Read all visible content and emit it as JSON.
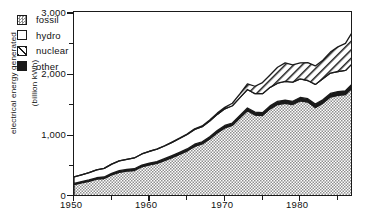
{
  "chart_data": {
    "type": "area",
    "stacked": true,
    "title": "",
    "xlabel": "",
    "ylabel": "electrical energy generated\n(billion kWh)",
    "xlim": [
      1950,
      1987
    ],
    "ylim": [
      0,
      3000
    ],
    "ytick_labels": [
      "0",
      "1,000",
      "2,000",
      "3,000"
    ],
    "ytick_values": [
      0,
      1000,
      2000,
      3000
    ],
    "yminor_ticks": [
      500,
      1500,
      2500
    ],
    "xtick_labels": [
      "1950",
      "1960",
      "1970",
      "1980"
    ],
    "xtick_values": [
      1950,
      1960,
      1970,
      1980
    ],
    "xminor_ticks": [
      1955,
      1965,
      1975,
      1985
    ],
    "grid": false,
    "legend_position": "upper-left",
    "x": [
      1950,
      1951,
      1952,
      1953,
      1954,
      1955,
      1956,
      1957,
      1958,
      1959,
      1960,
      1961,
      1962,
      1963,
      1964,
      1965,
      1966,
      1967,
      1968,
      1969,
      1970,
      1971,
      1972,
      1973,
      1974,
      1975,
      1976,
      1977,
      1978,
      1979,
      1980,
      1981,
      1982,
      1983,
      1984,
      1985,
      1986,
      1987
    ],
    "series": [
      {
        "name": "fossil",
        "pattern": "crosshatch",
        "values": [
          200,
          230,
          255,
          290,
          300,
          360,
          400,
          420,
          430,
          490,
          520,
          545,
          590,
          640,
          690,
          745,
          820,
          860,
          940,
          1040,
          1120,
          1160,
          1280,
          1400,
          1330,
          1320,
          1430,
          1500,
          1520,
          1500,
          1560,
          1540,
          1450,
          1520,
          1620,
          1650,
          1660,
          1780
        ]
      },
      {
        "name": "other",
        "pattern": "solid-black",
        "values": [
          20,
          20,
          22,
          22,
          24,
          24,
          26,
          26,
          28,
          28,
          30,
          30,
          32,
          32,
          34,
          34,
          36,
          36,
          38,
          38,
          40,
          40,
          42,
          44,
          46,
          46,
          48,
          50,
          50,
          52,
          54,
          54,
          56,
          58,
          60,
          60,
          62,
          64
        ]
      },
      {
        "name": "hydro",
        "pattern": "white",
        "values": [
          105,
          110,
          118,
          128,
          140,
          150,
          160,
          165,
          175,
          180,
          190,
          200,
          205,
          215,
          225,
          235,
          240,
          245,
          255,
          262,
          270,
          280,
          290,
          300,
          300,
          310,
          300,
          295,
          305,
          310,
          300,
          295,
          320,
          340,
          330,
          325,
          330,
          330
        ]
      },
      {
        "name": "nuclear",
        "pattern": "diagonal-hatch",
        "values": [
          0,
          0,
          0,
          0,
          0,
          0,
          0,
          0,
          0,
          0,
          2,
          3,
          4,
          5,
          6,
          8,
          10,
          12,
          16,
          20,
          25,
          40,
          60,
          90,
          120,
          180,
          200,
          260,
          300,
          280,
          260,
          290,
          300,
          300,
          340,
          400,
          440,
          520
        ]
      }
    ],
    "totals_note": "values are stacked; top of stack reaches about 2,700 billion kWh at the right edge",
    "colors": {
      "axis": "#1a1a1a",
      "text": "#111111",
      "fossil": "#9a9a9a",
      "hydro": "#ffffff",
      "nuclear": "#ffffff",
      "other": "#1a1a1a",
      "background": "#ffffff"
    }
  },
  "legend": {
    "items": [
      {
        "label": "fossil",
        "swatch": "crosshatch-swatch"
      },
      {
        "label": "hydro",
        "swatch": "white-swatch"
      },
      {
        "label": "nuclear",
        "swatch": "diagonal-hatch-swatch"
      },
      {
        "label": "other",
        "swatch": "solid-black-swatch"
      }
    ]
  },
  "axes": {
    "y": {
      "title_line1": "electrical energy generated",
      "title_line2": "(billion kWh)",
      "labels": [
        "3,000",
        "2,000",
        "1,000",
        "0"
      ]
    },
    "x": {
      "labels": [
        "1950",
        "1960",
        "1970",
        "1980"
      ]
    }
  }
}
